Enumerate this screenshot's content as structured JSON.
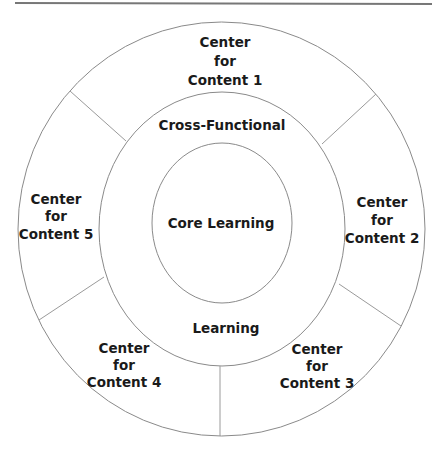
{
  "diagram": {
    "type": "concentric-ring-diagram",
    "core": {
      "label": "Core Learning"
    },
    "middle_ring": {
      "label_top": "Cross-Functional",
      "label_bottom": "Learning"
    },
    "outer_ring": {
      "segments": [
        {
          "id": 1,
          "lines": [
            "Center",
            "for",
            "Content 1"
          ]
        },
        {
          "id": 2,
          "lines": [
            "Center",
            "for",
            "Content 2"
          ]
        },
        {
          "id": 3,
          "lines": [
            "Center",
            "for",
            "Content 3"
          ]
        },
        {
          "id": 4,
          "lines": [
            "Center",
            "for",
            "Content 4"
          ]
        },
        {
          "id": 5,
          "lines": [
            "Center",
            "for",
            "Content 5"
          ]
        }
      ]
    },
    "colors": {
      "background": "#ffffff",
      "stroke": "#8a8a8a",
      "text": "#1a1a1a"
    }
  }
}
